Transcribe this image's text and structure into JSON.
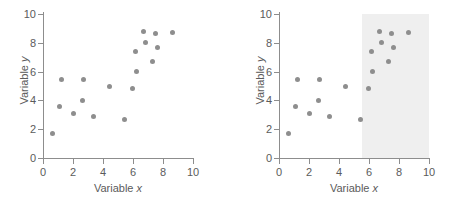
{
  "figure": {
    "panels": [
      {
        "id": "left",
        "name": "scatter-plot-unshaded",
        "shaded": false
      },
      {
        "id": "right",
        "name": "scatter-plot-shaded",
        "shaded": true
      }
    ]
  },
  "chart_data": [
    {
      "type": "scatter",
      "title": "",
      "xlabel": "Variable x",
      "ylabel": "Variable y",
      "xlim": [
        0,
        10
      ],
      "ylim": [
        0,
        10
      ],
      "xticks": [
        0,
        2,
        4,
        6,
        8,
        10
      ],
      "yticks": [
        0,
        2,
        4,
        6,
        8,
        10
      ],
      "grid": false,
      "legend": null,
      "marker_color": "#8e8e8e",
      "points": [
        {
          "x": 0.6,
          "y": 1.7
        },
        {
          "x": 1.1,
          "y": 3.6
        },
        {
          "x": 1.2,
          "y": 5.45
        },
        {
          "x": 2.05,
          "y": 3.1
        },
        {
          "x": 2.65,
          "y": 4.0
        },
        {
          "x": 2.7,
          "y": 5.45
        },
        {
          "x": 3.35,
          "y": 2.85
        },
        {
          "x": 4.4,
          "y": 5.0
        },
        {
          "x": 5.45,
          "y": 2.7
        },
        {
          "x": 5.95,
          "y": 4.85
        },
        {
          "x": 6.15,
          "y": 7.4
        },
        {
          "x": 6.25,
          "y": 6.0
        },
        {
          "x": 6.7,
          "y": 8.8
        },
        {
          "x": 6.8,
          "y": 8.0
        },
        {
          "x": 7.3,
          "y": 6.7
        },
        {
          "x": 7.5,
          "y": 8.65
        },
        {
          "x": 7.6,
          "y": 7.65
        },
        {
          "x": 8.6,
          "y": 8.7
        }
      ],
      "annotations": []
    },
    {
      "type": "scatter",
      "title": "",
      "xlabel": "Variable x",
      "ylabel": "Variable y",
      "xlim": [
        0,
        10
      ],
      "ylim": [
        0,
        10
      ],
      "xticks": [
        0,
        2,
        4,
        6,
        8,
        10
      ],
      "yticks": [
        0,
        2,
        4,
        6,
        8,
        10
      ],
      "grid": false,
      "legend": null,
      "marker_color": "#8e8e8e",
      "points": [
        {
          "x": 0.6,
          "y": 1.7
        },
        {
          "x": 1.1,
          "y": 3.6
        },
        {
          "x": 1.2,
          "y": 5.45
        },
        {
          "x": 2.05,
          "y": 3.1
        },
        {
          "x": 2.65,
          "y": 4.0
        },
        {
          "x": 2.7,
          "y": 5.45
        },
        {
          "x": 3.35,
          "y": 2.85
        },
        {
          "x": 4.4,
          "y": 5.0
        },
        {
          "x": 5.45,
          "y": 2.7
        },
        {
          "x": 5.95,
          "y": 4.85
        },
        {
          "x": 6.15,
          "y": 7.4
        },
        {
          "x": 6.25,
          "y": 6.0
        },
        {
          "x": 6.7,
          "y": 8.8
        },
        {
          "x": 6.8,
          "y": 8.0
        },
        {
          "x": 7.3,
          "y": 6.7
        },
        {
          "x": 7.5,
          "y": 8.65
        },
        {
          "x": 7.6,
          "y": 7.65
        },
        {
          "x": 8.6,
          "y": 8.7
        }
      ],
      "annotations": [
        {
          "kind": "shaded-region",
          "name": "highlight-region",
          "x_start": 5.5,
          "x_end": 10,
          "y_start": 0,
          "y_end": 10,
          "color": "#efefef"
        }
      ]
    }
  ]
}
